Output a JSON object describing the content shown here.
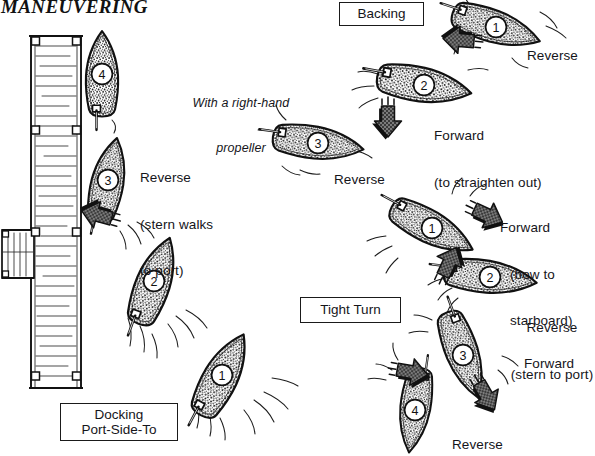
{
  "figure": {
    "title": "MANEUVERING",
    "note": "With a right-hand\npropeller",
    "ink": "#141414",
    "hull_fill": "#8d8d8d",
    "paper": "#ffffff"
  },
  "panels": [
    {
      "id": "docking",
      "label": "Docking\nPort-Side-To"
    },
    {
      "id": "backing",
      "label": "Backing"
    },
    {
      "id": "tightturn",
      "label": "Tight Turn"
    }
  ],
  "dock": {
    "name": "pier",
    "planks": 34,
    "pilings": 8,
    "ramp_planks": 5
  },
  "boats": [
    {
      "panel": "docking",
      "number": "1",
      "x": 222,
      "y": 375,
      "angle": 28,
      "length": 92,
      "beam": 34
    },
    {
      "panel": "docking",
      "number": "2",
      "x": 154,
      "y": 281,
      "angle": 20,
      "length": 92,
      "beam": 34
    },
    {
      "panel": "docking",
      "number": "3",
      "x": 108,
      "y": 180,
      "angle": 12,
      "length": 86,
      "beam": 32
    },
    {
      "panel": "docking",
      "number": "4",
      "x": 102,
      "y": 74,
      "angle": 0,
      "length": 86,
      "beam": 32
    },
    {
      "panel": "backing",
      "number": "1",
      "x": 496,
      "y": 27,
      "angle": 108,
      "length": 92,
      "beam": 32
    },
    {
      "panel": "backing",
      "number": "2",
      "x": 424,
      "y": 85,
      "angle": 100,
      "length": 96,
      "beam": 34
    },
    {
      "panel": "backing",
      "number": "3",
      "x": 318,
      "y": 143,
      "angle": 98,
      "length": 92,
      "beam": 32
    },
    {
      "panel": "tightturn",
      "number": "1",
      "x": 432,
      "y": 228,
      "angle": 118,
      "length": 92,
      "beam": 32
    },
    {
      "panel": "tightturn",
      "number": "2",
      "x": 490,
      "y": 277,
      "angle": 97,
      "length": 94,
      "beam": 32
    },
    {
      "panel": "tightturn",
      "number": "3",
      "x": 463,
      "y": 355,
      "angle": 160,
      "length": 92,
      "beam": 32
    },
    {
      "panel": "tightturn",
      "number": "4",
      "x": 415,
      "y": 410,
      "angle": 188,
      "length": 86,
      "beam": 30
    }
  ],
  "annotations": [
    {
      "id": "docking-reverse",
      "panel": "docking",
      "lines": [
        "Reverse",
        "(stern walks",
        "to port)"
      ]
    },
    {
      "id": "backing-reverse-1",
      "panel": "backing",
      "lines": [
        "Reverse"
      ]
    },
    {
      "id": "backing-forward-2",
      "panel": "backing",
      "lines": [
        "Forward",
        "(to straighten out)"
      ]
    },
    {
      "id": "backing-reverse-3",
      "panel": "backing",
      "lines": [
        "Reverse"
      ]
    },
    {
      "id": "tight-forward-1",
      "panel": "tightturn",
      "lines": [
        "Forward",
        "(bow to",
        "starboard)"
      ]
    },
    {
      "id": "tight-reverse-2",
      "panel": "tightturn",
      "lines": [
        "Reverse",
        "(stern to port)"
      ]
    },
    {
      "id": "tight-forward-3",
      "panel": "tightturn",
      "lines": [
        "Forward"
      ]
    },
    {
      "id": "tight-reverse-4",
      "panel": "tightturn",
      "lines": [
        "Reverse"
      ]
    }
  ],
  "labels": {
    "title": "MANEUVERING",
    "propeller_note_l1": "With a right-hand",
    "propeller_note_l2": "propeller",
    "docking_box": "Docking\nPort-Side-To",
    "backing_box": "Backing",
    "tightturn_box": "Tight Turn",
    "docking_reverse_l1": "Reverse",
    "docking_reverse_l2": "(stern walks",
    "docking_reverse_l3": "to port)",
    "backing_reverse_top": "Reverse",
    "backing_forward_l1": "Forward",
    "backing_forward_l2": "(to straighten out)",
    "backing_reverse_bottom": "Reverse",
    "tight_forward_l1": "Forward",
    "tight_forward_l2": "(bow to",
    "tight_forward_l3": "starboard)",
    "tight_reverse_l1": "Reverse",
    "tight_reverse_l2": "(stern to port)",
    "tight_forward_3": "Forward",
    "tight_reverse_4": "Reverse"
  },
  "arrows": [
    {
      "id": "arrow-docking-to-dock",
      "x": 98,
      "y": 215,
      "rot": 195
    },
    {
      "id": "arrow-backing-1",
      "x": 460,
      "y": 40,
      "rot": 185
    },
    {
      "id": "arrow-backing-2",
      "x": 388,
      "y": 120,
      "rot": 90
    },
    {
      "id": "arrow-tight-1",
      "x": 487,
      "y": 215,
      "rot": 25
    },
    {
      "id": "arrow-tight-2",
      "x": 449,
      "y": 263,
      "rot": -65
    },
    {
      "id": "arrow-tight-3",
      "x": 411,
      "y": 372,
      "rot": 10
    },
    {
      "id": "arrow-tight-4",
      "x": 486,
      "y": 395,
      "rot": 60
    }
  ]
}
